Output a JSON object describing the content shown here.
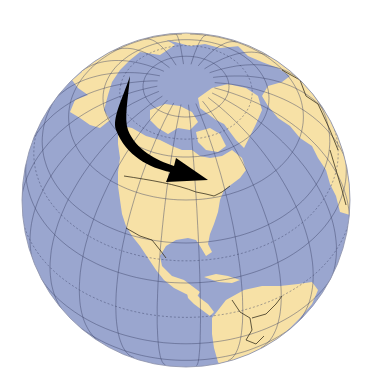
{
  "figure": {
    "title": "Globe view centered on North America with migration arrow",
    "projection": "orthographic",
    "colors": {
      "ocean": "#9aa6cf",
      "land": "#f7e1a6",
      "graticule": "#3c4468",
      "border": "#3a3220",
      "arrow": "#000000",
      "background": "#ffffff"
    },
    "regions_visible": [
      "Arctic Ocean",
      "Greenland",
      "Canada",
      "Alaska",
      "United States",
      "Mexico",
      "Central America",
      "Caribbean",
      "South America",
      "Europe",
      "Atlantic Ocean",
      "Pacific Ocean"
    ],
    "arrow": {
      "description": "Curved arrow from Alaska/Arctic sweeping southeast toward eastern Canada",
      "from": "Alaska / Arctic",
      "to": "Eastern Canada"
    }
  }
}
